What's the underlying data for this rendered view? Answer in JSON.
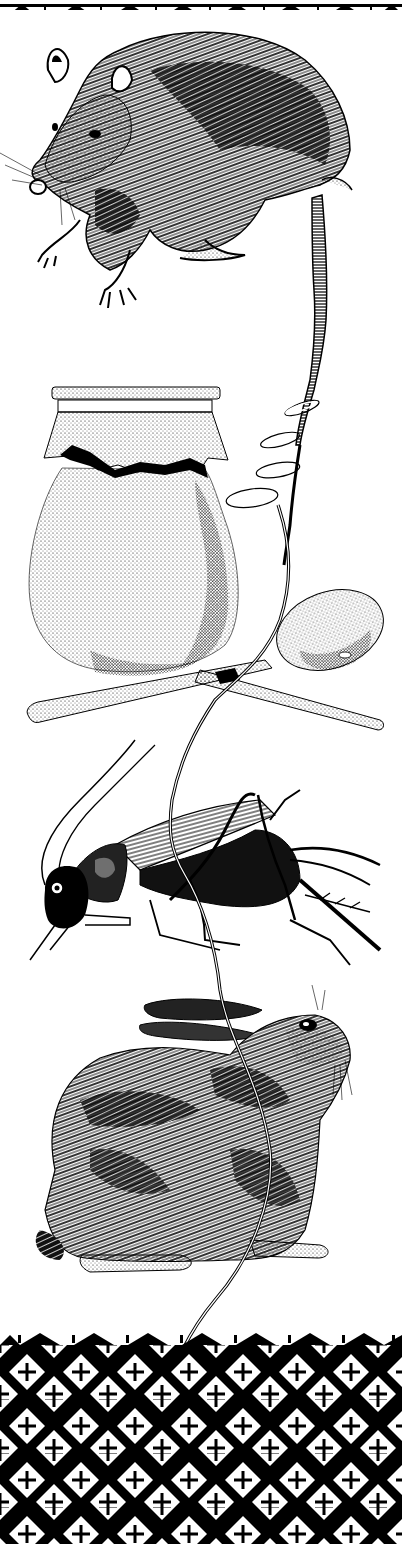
{
  "illustration": {
    "background_color": "#ffffff",
    "ink_color": "#000000",
    "elements": [
      {
        "id": "top-border",
        "kind": "decorative border",
        "motif": "black triangles with vertical ticks"
      },
      {
        "id": "opossum",
        "kind": "animal drawing",
        "subject": "opossum"
      },
      {
        "id": "jar",
        "kind": "object drawing",
        "subject": "stippled jar with cloth cover"
      },
      {
        "id": "spoon",
        "kind": "object drawing",
        "subject": "wooden spoon"
      },
      {
        "id": "cricket",
        "kind": "animal drawing",
        "subject": "cricket"
      },
      {
        "id": "rabbit",
        "kind": "animal drawing",
        "subject": "rabbit"
      },
      {
        "id": "string",
        "kind": "connector",
        "subject": "string threading all figures from opossum tail downward"
      },
      {
        "id": "bottom-pattern",
        "kind": "decorative pattern",
        "motif": "white diamonds with black crosses on black lattice"
      }
    ]
  }
}
